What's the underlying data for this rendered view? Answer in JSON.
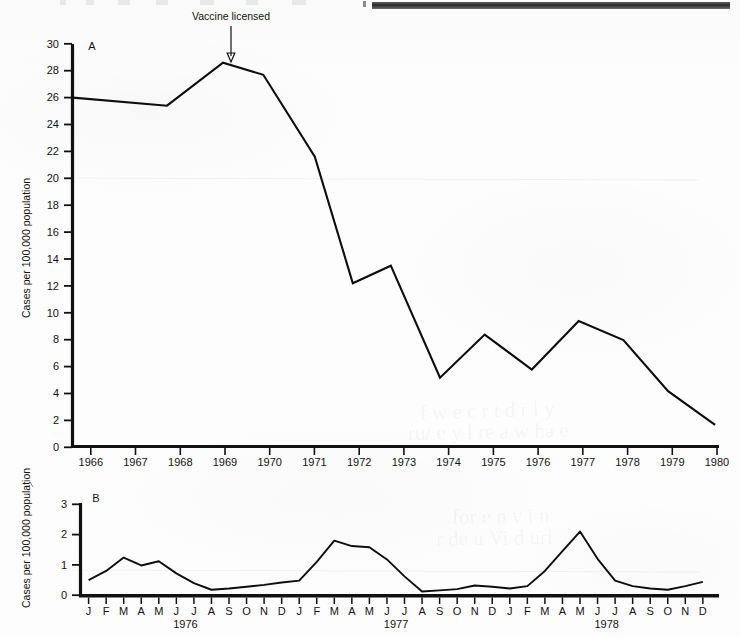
{
  "figure": {
    "background_color": "#fdfdfd",
    "ink_color": "#0d0d0d",
    "top_cut_bar_color": "#2b2b2b"
  },
  "annotations": {
    "vaccine_licensed_label": "Vaccine licensed",
    "vaccine_licensed_year": 1969
  },
  "chart_data": [
    {
      "type": "line",
      "panel": "A",
      "title": "",
      "xlabel": "",
      "ylabel": "Cases per 100,000 population",
      "xlim": [
        1965.5,
        1980.0
      ],
      "ylim": [
        0,
        30
      ],
      "yticks": [
        0,
        2,
        4,
        6,
        8,
        10,
        12,
        14,
        16,
        18,
        20,
        22,
        24,
        26,
        28,
        30
      ],
      "ytick_labels": [
        "0",
        "2",
        "4",
        "6",
        "8",
        "10",
        "12",
        "14",
        "16",
        "18",
        "20",
        "22",
        "24",
        "26",
        "28",
        "30"
      ],
      "xticks": [
        1966,
        1967,
        1968,
        1969,
        1970,
        1971,
        1972,
        1973,
        1974,
        1975,
        1976,
        1977,
        1978,
        1979,
        1980
      ],
      "xtick_labels": [
        "1966",
        "1967",
        "1968",
        "1969",
        "1970",
        "1971",
        "1972",
        "1973",
        "1974",
        "1975",
        "1976",
        "1977",
        "1978",
        "1979",
        "1980"
      ],
      "grid": false,
      "legend": "none",
      "x": [
        1965.6,
        1967.7,
        1968.95,
        1969.85,
        1971.0,
        1971.85,
        1972.7,
        1973.8,
        1974.8,
        1975.85,
        1976.9,
        1977.9,
        1978.9,
        1979.95
      ],
      "values": [
        26.0,
        25.4,
        28.6,
        27.7,
        21.6,
        12.2,
        13.5,
        5.2,
        8.4,
        5.8,
        9.4,
        8.0,
        4.2,
        1.7
      ],
      "annotations": [
        {
          "text": "Vaccine licensed",
          "x": 1969.0,
          "y": 28.6
        }
      ]
    },
    {
      "type": "line",
      "panel": "B",
      "title": "",
      "xlabel": "",
      "ylabel": "Cases per 100,000 population",
      "xlim": [
        0,
        36
      ],
      "ylim": [
        0,
        3
      ],
      "yticks": [
        0,
        1,
        2,
        3
      ],
      "ytick_labels": [
        "0",
        "1",
        "2",
        "3"
      ],
      "grid": false,
      "legend": "none",
      "xtick_labels": [
        "J",
        "F",
        "M",
        "A",
        "M",
        "J",
        "J",
        "A",
        "S",
        "O",
        "N",
        "D",
        "J",
        "F",
        "M",
        "A",
        "M",
        "J",
        "J",
        "A",
        "S",
        "O",
        "N",
        "D",
        "J",
        "F",
        "M",
        "A",
        "M",
        "J",
        "J",
        "A",
        "S",
        "O",
        "N",
        "D"
      ],
      "year_groups": [
        {
          "label": "1976",
          "center_index": 5.5
        },
        {
          "label": "1977",
          "center_index": 17.5
        },
        {
          "label": "1978",
          "center_index": 29.5
        }
      ],
      "categories": [
        "1976-J",
        "1976-F",
        "1976-M",
        "1976-A",
        "1976-M",
        "1976-J",
        "1976-J",
        "1976-A",
        "1976-S",
        "1976-O",
        "1976-N",
        "1976-D",
        "1977-J",
        "1977-F",
        "1977-M",
        "1977-A",
        "1977-M",
        "1977-J",
        "1977-J",
        "1977-A",
        "1977-S",
        "1977-O",
        "1977-N",
        "1977-D",
        "1978-J",
        "1978-F",
        "1978-M",
        "1978-A",
        "1978-M",
        "1978-J",
        "1978-J",
        "1978-A",
        "1978-S",
        "1978-O",
        "1978-N",
        "1978-D"
      ],
      "values": [
        0.5,
        0.8,
        1.24,
        0.98,
        1.12,
        0.72,
        0.4,
        0.18,
        0.22,
        0.28,
        0.34,
        0.42,
        0.48,
        1.1,
        1.8,
        1.62,
        1.58,
        1.18,
        0.62,
        0.12,
        0.16,
        0.2,
        0.32,
        0.28,
        0.22,
        0.3,
        0.8,
        1.45,
        2.1,
        1.2,
        0.48,
        0.3,
        0.22,
        0.18,
        0.3,
        0.44
      ]
    }
  ]
}
